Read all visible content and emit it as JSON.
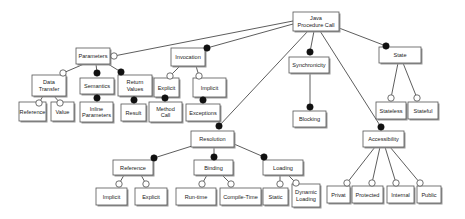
{
  "diagram": {
    "type": "feature-model",
    "legend_semantics": {
      "filled_circle": "mandatory",
      "hollow_circle": "optional"
    },
    "nodes": [
      {
        "id": "root",
        "label": [
          "Java",
          "Procedure Call"
        ]
      },
      {
        "id": "parameters",
        "label": [
          "Parameters"
        ]
      },
      {
        "id": "invocation",
        "label": [
          "Invocation"
        ]
      },
      {
        "id": "synchronicity",
        "label": [
          "Synchronicity"
        ]
      },
      {
        "id": "state",
        "label": [
          "State"
        ]
      },
      {
        "id": "data_transfer",
        "label": [
          "Data",
          "Transfer"
        ]
      },
      {
        "id": "semantics",
        "label": [
          "Semantics"
        ]
      },
      {
        "id": "return_values",
        "label": [
          "Return",
          "Values"
        ]
      },
      {
        "id": "explicit_inv",
        "label": [
          "Explicit"
        ]
      },
      {
        "id": "implicit_inv",
        "label": [
          "Implicit"
        ]
      },
      {
        "id": "reference_dt",
        "label": [
          "Reference"
        ]
      },
      {
        "id": "value",
        "label": [
          "Value"
        ]
      },
      {
        "id": "inline_parameters",
        "label": [
          "Inline",
          "Parameters"
        ]
      },
      {
        "id": "result",
        "label": [
          "Result"
        ]
      },
      {
        "id": "method_call",
        "label": [
          "Method",
          "Call"
        ]
      },
      {
        "id": "exceptions",
        "label": [
          "Exceptions"
        ]
      },
      {
        "id": "blocking",
        "label": [
          "Blocking"
        ]
      },
      {
        "id": "stateless",
        "label": [
          "Stateless"
        ]
      },
      {
        "id": "stateful",
        "label": [
          "Stateful"
        ]
      },
      {
        "id": "resolution",
        "label": [
          "Resolution"
        ]
      },
      {
        "id": "accessibility",
        "label": [
          "Accessibility"
        ]
      },
      {
        "id": "reference_res",
        "label": [
          "Reference"
        ]
      },
      {
        "id": "binding",
        "label": [
          "Binding"
        ]
      },
      {
        "id": "loading",
        "label": [
          "Loading"
        ]
      },
      {
        "id": "implicit_ref",
        "label": [
          "Implicit"
        ]
      },
      {
        "id": "explicit_ref",
        "label": [
          "Explicit"
        ]
      },
      {
        "id": "run_time",
        "label": [
          "Run-time"
        ]
      },
      {
        "id": "compile_time",
        "label": [
          "Compile-Time"
        ]
      },
      {
        "id": "static",
        "label": [
          "Static"
        ]
      },
      {
        "id": "dynamic_loading",
        "label": [
          "Dynamic",
          "Loading"
        ]
      },
      {
        "id": "privat",
        "label": [
          "Privat"
        ]
      },
      {
        "id": "protected",
        "label": [
          "Protected"
        ]
      },
      {
        "id": "internal",
        "label": [
          "Internal"
        ]
      },
      {
        "id": "public",
        "label": [
          "Public"
        ]
      }
    ],
    "edges": [
      {
        "from": "root",
        "to": "parameters",
        "kind": "optional"
      },
      {
        "from": "root",
        "to": "invocation",
        "kind": "mandatory"
      },
      {
        "from": "root",
        "to": "synchronicity",
        "kind": "mandatory"
      },
      {
        "from": "root",
        "to": "state",
        "kind": "mandatory"
      },
      {
        "from": "root",
        "to": "resolution",
        "kind": "mandatory"
      },
      {
        "from": "root",
        "to": "accessibility",
        "kind": "mandatory"
      },
      {
        "from": "parameters",
        "to": "data_transfer",
        "kind": "optional"
      },
      {
        "from": "parameters",
        "to": "semantics",
        "kind": "mandatory"
      },
      {
        "from": "parameters",
        "to": "return_values",
        "kind": "mandatory"
      },
      {
        "from": "data_transfer",
        "to": "reference_dt",
        "kind": "optional"
      },
      {
        "from": "data_transfer",
        "to": "value",
        "kind": "optional"
      },
      {
        "from": "semantics",
        "to": "inline_parameters",
        "kind": "mandatory"
      },
      {
        "from": "return_values",
        "to": "result",
        "kind": "mandatory"
      },
      {
        "from": "invocation",
        "to": "explicit_inv",
        "kind": "optional"
      },
      {
        "from": "invocation",
        "to": "implicit_inv",
        "kind": "optional"
      },
      {
        "from": "explicit_inv",
        "to": "method_call",
        "kind": "mandatory"
      },
      {
        "from": "implicit_inv",
        "to": "exceptions",
        "kind": "mandatory"
      },
      {
        "from": "synchronicity",
        "to": "blocking",
        "kind": "mandatory"
      },
      {
        "from": "state",
        "to": "stateless",
        "kind": "optional"
      },
      {
        "from": "state",
        "to": "stateful",
        "kind": "optional"
      },
      {
        "from": "resolution",
        "to": "reference_res",
        "kind": "mandatory"
      },
      {
        "from": "resolution",
        "to": "binding",
        "kind": "mandatory"
      },
      {
        "from": "resolution",
        "to": "loading",
        "kind": "mandatory"
      },
      {
        "from": "reference_res",
        "to": "implicit_ref",
        "kind": "optional"
      },
      {
        "from": "reference_res",
        "to": "explicit_ref",
        "kind": "optional"
      },
      {
        "from": "binding",
        "to": "run_time",
        "kind": "optional"
      },
      {
        "from": "binding",
        "to": "compile_time",
        "kind": "optional"
      },
      {
        "from": "loading",
        "to": "static",
        "kind": "optional"
      },
      {
        "from": "loading",
        "to": "dynamic_loading",
        "kind": "optional"
      },
      {
        "from": "accessibility",
        "to": "privat",
        "kind": "optional"
      },
      {
        "from": "accessibility",
        "to": "protected",
        "kind": "optional"
      },
      {
        "from": "accessibility",
        "to": "internal",
        "kind": "optional"
      },
      {
        "from": "accessibility",
        "to": "public",
        "kind": "optional"
      }
    ]
  }
}
